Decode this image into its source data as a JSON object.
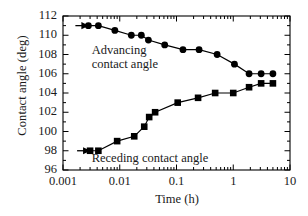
{
  "chart_data": {
    "type": "line",
    "title": "",
    "xlabel": "Time (h)",
    "ylabel": "Contact angle (deg)",
    "xscale": "log",
    "yscale": "linear",
    "xlim": [
      0.001,
      10
    ],
    "ylim": [
      96,
      112
    ],
    "xticks": [
      0.001,
      0.01,
      0.1,
      1,
      10
    ],
    "xticklabels": [
      "0.001",
      "0.01",
      "0.1",
      "1",
      "10"
    ],
    "yticks": [
      96,
      98,
      100,
      102,
      104,
      106,
      108,
      110,
      112
    ],
    "yticklabels": [
      "96",
      "98",
      "100",
      "102",
      "104",
      "106",
      "108",
      "110",
      "112"
    ],
    "y_minor_tick_step": 1,
    "grid": false,
    "legend": "none",
    "series": [
      {
        "name": "Advancing contact angle",
        "marker": "filled-circle",
        "color": "#000000",
        "start_arrow": true,
        "points": [
          {
            "x": 0.0028,
            "y": 111.0
          },
          {
            "x": 0.0042,
            "y": 111.0
          },
          {
            "x": 0.0082,
            "y": 110.5
          },
          {
            "x": 0.016,
            "y": 110.0
          },
          {
            "x": 0.024,
            "y": 110.0
          },
          {
            "x": 0.032,
            "y": 109.5
          },
          {
            "x": 0.062,
            "y": 109.0
          },
          {
            "x": 0.13,
            "y": 108.5
          },
          {
            "x": 0.25,
            "y": 108.5
          },
          {
            "x": 0.52,
            "y": 108.0
          },
          {
            "x": 1.05,
            "y": 107.0
          },
          {
            "x": 1.9,
            "y": 106.0
          },
          {
            "x": 3.1,
            "y": 106.0
          },
          {
            "x": 5.0,
            "y": 106.0
          }
        ]
      },
      {
        "name": "Receding contact angle",
        "marker": "filled-square",
        "color": "#000000",
        "start_arrow": true,
        "points": [
          {
            "x": 0.003,
            "y": 98.0
          },
          {
            "x": 0.0042,
            "y": 98.0
          },
          {
            "x": 0.009,
            "y": 99.0
          },
          {
            "x": 0.018,
            "y": 99.5
          },
          {
            "x": 0.027,
            "y": 100.5
          },
          {
            "x": 0.033,
            "y": 101.5
          },
          {
            "x": 0.042,
            "y": 102.0
          },
          {
            "x": 0.105,
            "y": 103.0
          },
          {
            "x": 0.24,
            "y": 103.5
          },
          {
            "x": 0.48,
            "y": 104.0
          },
          {
            "x": 1.0,
            "y": 104.0
          },
          {
            "x": 1.9,
            "y": 104.6
          },
          {
            "x": 3.1,
            "y": 105.0
          },
          {
            "x": 5.0,
            "y": 105.0
          }
        ]
      }
    ],
    "annotations": [
      {
        "id": "advancing",
        "lines": [
          "Advancing",
          "contact angle"
        ],
        "x": 0.0032,
        "y": 108.4
      },
      {
        "id": "receding",
        "lines": [
          "Receding contact angle"
        ],
        "x": 0.0032,
        "y": 97.1
      }
    ]
  }
}
